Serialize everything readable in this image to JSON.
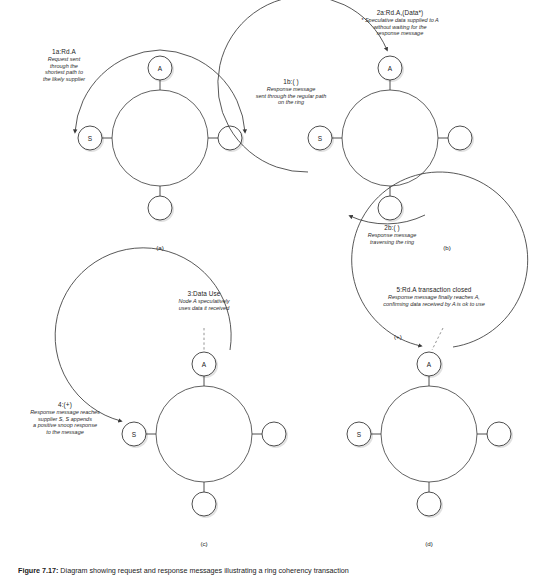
{
  "figure": {
    "caption_label": "Figure 7.17:",
    "caption_text": "Diagram showing request and response messages illustrating a ring coherency transaction",
    "width": 550,
    "height": 580,
    "stroke_color": "#3a3a3a",
    "shadow_color": "#bdbdbd",
    "text_color": "#1b1b1b"
  },
  "panels": [
    {
      "id": "a",
      "subcaption": "(a)",
      "nodes": [
        {
          "position": "top",
          "label": "A"
        },
        {
          "position": "left",
          "label": "S"
        },
        {
          "position": "right",
          "label": ""
        },
        {
          "position": "bottom",
          "label": ""
        }
      ],
      "annotations": [
        {
          "name": "request-sent",
          "heading": "1a:Rd.A",
          "lines": [
            "Request sent",
            "through the",
            "shortest path to",
            "the likely supplier"
          ]
        },
        {
          "name": "response-regular-path",
          "heading": "1b:( )",
          "lines": [
            "Response message",
            "sent through the regular path",
            "on the ring"
          ]
        }
      ]
    },
    {
      "id": "b",
      "subcaption": "(b)",
      "nodes": [
        {
          "position": "top",
          "label": "A"
        },
        {
          "position": "left",
          "label": "S"
        },
        {
          "position": "right",
          "label": ""
        },
        {
          "position": "bottom",
          "label": ""
        }
      ],
      "annotations": [
        {
          "name": "speculative-data",
          "heading": "2a:Rd.A,(Data*)",
          "lines": [
            "* Speculative data supplied to A",
            "without waiting for the",
            "response message"
          ]
        },
        {
          "name": "response-traversing-ring",
          "heading": "2b:( )",
          "lines": [
            "Response message",
            "traversing the ring"
          ]
        }
      ]
    },
    {
      "id": "c",
      "subcaption": "(c)",
      "nodes": [
        {
          "position": "top",
          "label": "A"
        },
        {
          "position": "left",
          "label": "S"
        },
        {
          "position": "right",
          "label": ""
        },
        {
          "position": "bottom",
          "label": ""
        }
      ],
      "annotations": [
        {
          "name": "data-use",
          "heading": "3:Data Use",
          "lines": [
            "Node A speculatively",
            "uses data it received"
          ]
        },
        {
          "name": "snoop-response-appended",
          "heading": "4:(+)",
          "lines": [
            "Response message reaches",
            "supplier S, S appends",
            "a positive snoop response",
            "to the message"
          ]
        }
      ]
    },
    {
      "id": "d",
      "subcaption": "(d)",
      "plus_marker": "(+)",
      "nodes": [
        {
          "position": "top",
          "label": "A"
        },
        {
          "position": "left",
          "label": "S"
        },
        {
          "position": "right",
          "label": ""
        },
        {
          "position": "bottom",
          "label": ""
        }
      ],
      "annotations": [
        {
          "name": "transaction-closed",
          "heading": "5:Rd.A transaction closed",
          "lines": [
            "Response message finally reaches A,",
            "confirming data received by A is ok to use"
          ]
        }
      ]
    }
  ]
}
